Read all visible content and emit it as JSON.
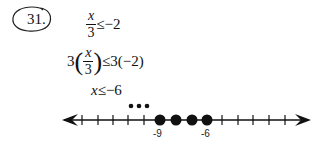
{
  "problem": {
    "number": "31.",
    "steps": [
      {
        "id": "step1",
        "numerator": "x",
        "denominator": "3",
        "relation": "≤",
        "rhs": "−2"
      },
      {
        "id": "step2",
        "coef": "3",
        "numerator": "x",
        "denominator": "3",
        "relation": "≤",
        "rhs": "3(−2)"
      },
      {
        "id": "step3",
        "variable": "x",
        "relation": "≤",
        "rhs": "−6"
      }
    ]
  },
  "number_line": {
    "labels": [
      {
        "value": "-9"
      },
      {
        "value": "-6"
      }
    ],
    "filled_points": [
      -9,
      -8,
      -7,
      -6
    ],
    "continuation_dots": "•••",
    "range": [
      -15,
      2
    ],
    "colors": {
      "line": "#111111",
      "points": "#111111"
    }
  }
}
